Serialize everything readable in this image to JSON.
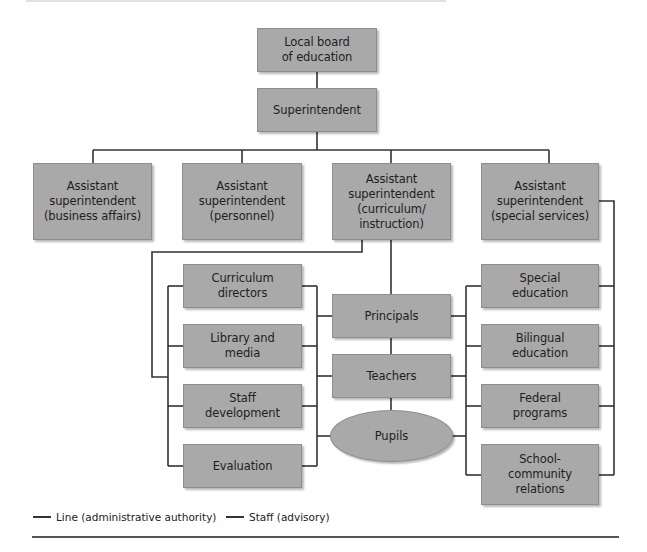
{
  "diagram": {
    "type": "organizational-chart",
    "colors": {
      "box_fill": "#a9a9a9",
      "box_border": "#8e8e8e",
      "line": "#333333",
      "background": "#ffffff"
    },
    "top": {
      "board": "Local board\nof education",
      "superintendent": "Superintendent"
    },
    "assistants": [
      {
        "label": "Assistant\nsuperintendent\n(business affairs)"
      },
      {
        "label": "Assistant\nsuperintendent\n(personnel)"
      },
      {
        "label": "Assistant\nsuperintendent\n(curriculum/\ninstruction)"
      },
      {
        "label": "Assistant\nsuperintendent\n(special services)"
      }
    ],
    "left_staff": [
      {
        "label": "Curriculum\ndirectors"
      },
      {
        "label": "Library and\nmedia"
      },
      {
        "label": "Staff\ndevelopment"
      },
      {
        "label": "Evaluation"
      }
    ],
    "center": [
      {
        "label": "Principals"
      },
      {
        "label": "Teachers"
      },
      {
        "label": "Pupils"
      }
    ],
    "right_staff": [
      {
        "label": "Special\neducation"
      },
      {
        "label": "Bilingual\neducation"
      },
      {
        "label": "Federal\nprograms"
      },
      {
        "label": "School-\ncommunity\nrelations"
      }
    ],
    "legend": {
      "line": "Line (administrative authority)",
      "staff": "Staff (advisory)"
    }
  }
}
